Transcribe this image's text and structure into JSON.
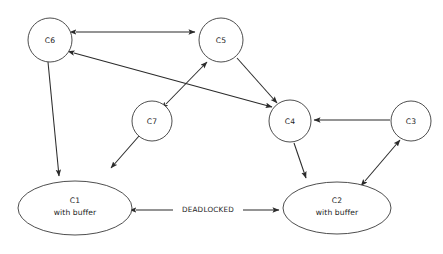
{
  "diagram": {
    "type": "directed-graph",
    "background_color": "#ffffff",
    "stroke_color": "#2b2b2b",
    "node_stroke_color": "#3a3a3a",
    "text_color": "#1c1c1c",
    "nodes": [
      {
        "id": "C6",
        "label": "C6",
        "sublabel": "",
        "shape": "circle",
        "cx": 50,
        "cy": 40,
        "r": 22
      },
      {
        "id": "C5",
        "label": "C5",
        "sublabel": "",
        "shape": "circle",
        "cx": 221,
        "cy": 40,
        "r": 22
      },
      {
        "id": "C7",
        "label": "C7",
        "sublabel": "",
        "shape": "circle",
        "cx": 152,
        "cy": 121,
        "r": 20
      },
      {
        "id": "C4",
        "label": "C4",
        "sublabel": "",
        "shape": "circle",
        "cx": 290,
        "cy": 121,
        "r": 21
      },
      {
        "id": "C3",
        "label": "C3",
        "sublabel": "",
        "shape": "circle",
        "cx": 411,
        "cy": 121,
        "r": 20
      },
      {
        "id": "C1",
        "label": "C1",
        "sublabel": "with buffer",
        "shape": "ellipse",
        "cx": 75,
        "cy": 208,
        "rx": 57,
        "ry": 27
      },
      {
        "id": "C2",
        "label": "C2",
        "sublabel": "with buffer",
        "shape": "ellipse",
        "cx": 337,
        "cy": 208,
        "rx": 54,
        "ry": 26
      }
    ],
    "edges": [
      {
        "id": "C6-C5",
        "from": "C6",
        "to": "C5",
        "direction": "bidirectional",
        "label": ""
      },
      {
        "id": "C6-C4",
        "from": "C6",
        "to": "C4",
        "direction": "bidirectional",
        "label": ""
      },
      {
        "id": "C7-C5",
        "from": "C7",
        "to": "C5",
        "direction": "bidirectional",
        "label": ""
      },
      {
        "id": "C5-C4",
        "from": "C5",
        "to": "C4",
        "direction": "forward",
        "label": ""
      },
      {
        "id": "C3-C4",
        "from": "C3",
        "to": "C4",
        "direction": "forward",
        "label": ""
      },
      {
        "id": "C6-C1",
        "from": "C6",
        "to": "C1",
        "direction": "forward",
        "label": ""
      },
      {
        "id": "C7-C1",
        "from": "C7",
        "to": "C1",
        "direction": "forward",
        "label": ""
      },
      {
        "id": "C4-C2",
        "from": "C4",
        "to": "C2",
        "direction": "forward",
        "label": ""
      },
      {
        "id": "C2-C3",
        "from": "C2",
        "to": "C3",
        "direction": "bidirectional",
        "label": ""
      },
      {
        "id": "C1-C2",
        "from": "C1",
        "to": "C2",
        "direction": "bidirectional",
        "label": "DEADLOCKED"
      }
    ],
    "labels": {
      "deadlocked": "DEADLOCKED",
      "with_buffer": "with buffer",
      "c1": "C1",
      "c2": "C2",
      "c3": "C3",
      "c4": "C4",
      "c5": "C5",
      "c6": "C6",
      "c7": "C7"
    }
  }
}
